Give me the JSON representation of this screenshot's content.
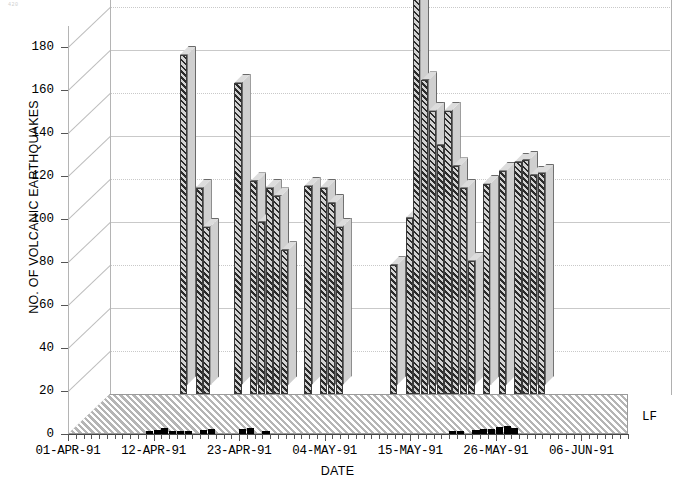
{
  "corner_mark": "420",
  "chart_data": {
    "type": "bar",
    "title": "",
    "subtitle": "",
    "xlabel": "DATE",
    "ylabel": "NO. OF VOLCANIC EARTHQUAKES",
    "ylim": [
      0,
      190
    ],
    "yticks": [
      0,
      20,
      40,
      60,
      80,
      100,
      120,
      140,
      160,
      180
    ],
    "grid": true,
    "legend_position": "right",
    "projection": "3d-two-row",
    "x_tick_labels": [
      "01-APR-91",
      "12-APR-91",
      "23-APR-91",
      "04-MAY-91",
      "15-MAY-91",
      "26-MAY-91",
      "06-JUN-91"
    ],
    "x_tick_positions": [
      0,
      11,
      22,
      33,
      44,
      55,
      66
    ],
    "x_minor_tick_interval_days": 1,
    "x_total_days": 72,
    "series": [
      {
        "name": "HF",
        "label": "HF",
        "color": "#b9b9b9",
        "values": [
          0,
          0,
          0,
          0,
          0,
          0,
          0,
          0,
          0,
          158,
          0,
          96,
          78,
          0,
          0,
          0,
          145,
          0,
          99,
          80,
          96,
          92,
          67,
          0,
          0,
          97,
          0,
          96,
          89,
          78,
          0,
          0,
          0,
          0,
          0,
          0,
          60,
          0,
          82,
          190,
          146,
          132,
          116,
          132,
          106,
          96,
          62,
          0,
          98,
          0,
          104,
          0,
          108,
          109,
          102,
          103,
          0,
          0,
          0,
          0,
          0,
          0,
          0,
          0,
          0,
          0,
          0,
          0,
          0,
          0,
          0,
          0
        ]
      },
      {
        "name": "LF",
        "label": "LF",
        "color": "#000000",
        "values": [
          0,
          0,
          0,
          0,
          0,
          0,
          0,
          0,
          0,
          0,
          4,
          5,
          7,
          4,
          4,
          3,
          0,
          5,
          6,
          0,
          0,
          0,
          6,
          7,
          0,
          3,
          0,
          0,
          0,
          0,
          0,
          0,
          0,
          0,
          0,
          0,
          0,
          0,
          0,
          0,
          0,
          0,
          0,
          0,
          0,
          0,
          0,
          0,
          0,
          4,
          4,
          0,
          5,
          6,
          6,
          8,
          9,
          7,
          0,
          0,
          0,
          0,
          0,
          0,
          0,
          0,
          0,
          0,
          0,
          0,
          0,
          0
        ]
      }
    ]
  },
  "legend": {
    "hf": "HF",
    "lf": "LF"
  }
}
